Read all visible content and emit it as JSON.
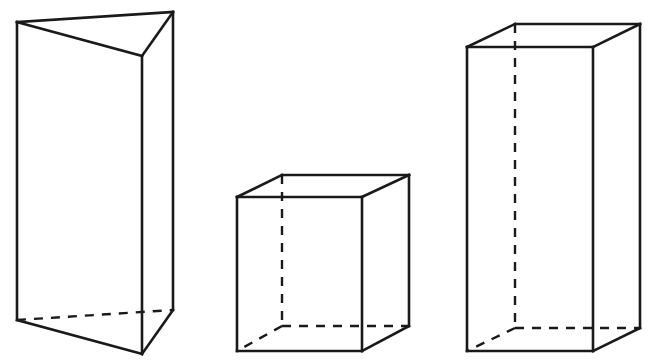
{
  "figure": {
    "colors": {
      "background": "#ffffff",
      "stroke": "#1a1a1a"
    },
    "shapes": [
      {
        "name": "triangular-prism",
        "visible_edges": [
          [
            17,
            22,
            173,
            12
          ],
          [
            173,
            12,
            142,
            56
          ],
          [
            142,
            56,
            17,
            22
          ],
          [
            17,
            22,
            17,
            320
          ],
          [
            142,
            56,
            142,
            354
          ],
          [
            173,
            12,
            173,
            310
          ],
          [
            17,
            320,
            142,
            354
          ],
          [
            142,
            354,
            173,
            310
          ]
        ],
        "hidden_edges": [
          [
            17,
            320,
            173,
            310
          ]
        ]
      },
      {
        "name": "cube",
        "visible_edges": [
          [
            237,
            197,
            362,
            197
          ],
          [
            362,
            197,
            362,
            351
          ],
          [
            362,
            351,
            237,
            351
          ],
          [
            237,
            351,
            237,
            197
          ],
          [
            237,
            197,
            282,
            175
          ],
          [
            282,
            175,
            409,
            175
          ],
          [
            409,
            175,
            362,
            197
          ],
          [
            409,
            175,
            409,
            326
          ],
          [
            409,
            326,
            362,
            351
          ]
        ],
        "hidden_edges": [
          [
            282,
            175,
            282,
            326
          ],
          [
            282,
            326,
            409,
            326
          ],
          [
            282,
            326,
            237,
            351
          ]
        ]
      },
      {
        "name": "rectangular-prism",
        "visible_edges": [
          [
            467,
            47,
            593,
            47
          ],
          [
            593,
            47,
            593,
            351
          ],
          [
            593,
            351,
            467,
            351
          ],
          [
            467,
            351,
            467,
            47
          ],
          [
            467,
            47,
            515,
            24
          ],
          [
            515,
            24,
            640,
            24
          ],
          [
            640,
            24,
            593,
            47
          ],
          [
            640,
            24,
            640,
            328
          ],
          [
            640,
            328,
            593,
            351
          ]
        ],
        "hidden_edges": [
          [
            515,
            24,
            515,
            328
          ],
          [
            515,
            328,
            640,
            328
          ],
          [
            515,
            328,
            467,
            351
          ]
        ]
      }
    ]
  }
}
